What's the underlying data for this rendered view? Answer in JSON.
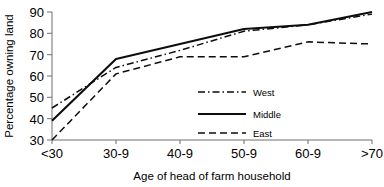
{
  "chart_data": {
    "type": "line",
    "title": "",
    "xlabel": "Age of head of farm household",
    "ylabel": "Percentage owning land",
    "categories": [
      "<30",
      "30-9",
      "40-9",
      "50-9",
      "60-9",
      ">70"
    ],
    "ylim": [
      30,
      90
    ],
    "yticks": [
      30,
      40,
      50,
      60,
      70,
      80,
      90
    ],
    "ytick_labels": [
      "30",
      "40",
      "50",
      "60",
      "70",
      "80",
      "90"
    ],
    "grid": false,
    "legend_position": "inside-lower-right",
    "series": [
      {
        "name": "West",
        "style": "dash-dot",
        "color": "#0d0d0d",
        "values": [
          45,
          64,
          72,
          81,
          84,
          89
        ]
      },
      {
        "name": "Middle",
        "style": "solid",
        "color": "#0d0d0d",
        "values": [
          39,
          68,
          75,
          82,
          84,
          90
        ]
      },
      {
        "name": "East",
        "style": "dashed",
        "color": "#0d0d0d",
        "values": [
          30,
          61,
          69,
          69,
          76,
          75
        ]
      }
    ]
  },
  "axes": {
    "y_title": "Percentage owning land",
    "x_title": "Age of head of farm household"
  },
  "legend": {
    "entries": [
      {
        "label": "West"
      },
      {
        "label": "Middle"
      },
      {
        "label": "East"
      }
    ]
  }
}
